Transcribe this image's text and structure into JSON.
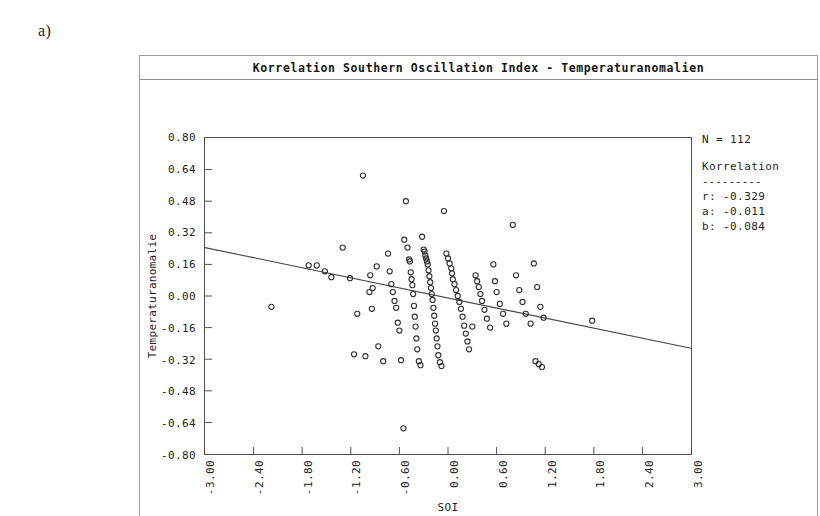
{
  "panel_label": "a)",
  "chart": {
    "title": "Korrelation Southern Oscillation Index - Temperaturanomalien",
    "y_axis_title": "Temperaturanomalie",
    "x_axis_title": "SOI"
  },
  "stats": {
    "n_label": "N = 112",
    "heading": "Korrelation",
    "rule": "---------",
    "r_line": "r: -0.329",
    "a_line": "a: -0.011",
    "b_line": "b: -0.084"
  },
  "chart_data": {
    "type": "scatter",
    "title": "Korrelation Southern Oscillation Index - Temperaturanomalien",
    "xlabel": "SOI",
    "ylabel": "Temperaturanomalie",
    "xlim": [
      -3.0,
      3.0
    ],
    "ylim": [
      -0.8,
      0.8
    ],
    "xticks": [
      -3.0,
      -2.4,
      -1.8,
      -1.2,
      -0.6,
      0.0,
      0.6,
      1.2,
      1.8,
      2.4,
      3.0
    ],
    "xtick_labels": [
      "-3.00",
      "-2.40",
      "-1.80",
      "-1.20",
      "-0.60",
      "0.00",
      "0.60",
      "1.20",
      "1.80",
      "2.40",
      "3.00"
    ],
    "yticks": [
      0.8,
      0.64,
      0.48,
      0.32,
      0.16,
      0.0,
      -0.16,
      -0.32,
      -0.48,
      -0.64,
      -0.8
    ],
    "ytick_labels": [
      "0.80",
      "0.64",
      "0.48",
      "0.32",
      "0.16",
      "0.00",
      "-0.16",
      "-0.32",
      "-0.48",
      "-0.64",
      "-0.80"
    ],
    "grid": false,
    "legend": "none",
    "marker": "open-circle",
    "n_points": 112,
    "correlation_r": -0.329,
    "fit_slope_a": -0.011,
    "fit_intercept_b": -0.084,
    "regression_line": {
      "x0": -3.0,
      "y0": 0.245,
      "x1": 3.0,
      "y1": -0.265
    },
    "points": [
      [
        -2.18,
        -0.055
      ],
      [
        -1.72,
        0.155
      ],
      [
        -1.62,
        0.155
      ],
      [
        -1.52,
        0.125
      ],
      [
        -1.44,
        0.095
      ],
      [
        -1.3,
        0.245
      ],
      [
        -1.05,
        0.61
      ],
      [
        -1.21,
        0.09
      ],
      [
        -1.12,
        -0.09
      ],
      [
        -1.16,
        -0.295
      ],
      [
        -1.02,
        -0.305
      ],
      [
        -0.96,
        0.105
      ],
      [
        -0.97,
        0.02
      ],
      [
        -0.93,
        0.04
      ],
      [
        -0.94,
        -0.065
      ],
      [
        -0.88,
        0.15
      ],
      [
        -0.86,
        -0.255
      ],
      [
        -0.8,
        -0.33
      ],
      [
        -0.74,
        0.215
      ],
      [
        -0.72,
        0.125
      ],
      [
        -0.7,
        0.06
      ],
      [
        -0.68,
        0.02
      ],
      [
        -0.66,
        -0.025
      ],
      [
        -0.64,
        -0.06
      ],
      [
        -0.62,
        -0.135
      ],
      [
        -0.6,
        -0.175
      ],
      [
        -0.58,
        -0.325
      ],
      [
        -0.55,
        -0.67
      ],
      [
        -0.52,
        0.48
      ],
      [
        -0.54,
        0.285
      ],
      [
        -0.5,
        0.245
      ],
      [
        -0.48,
        0.185
      ],
      [
        -0.47,
        0.175
      ],
      [
        -0.46,
        0.12
      ],
      [
        -0.45,
        0.085
      ],
      [
        -0.44,
        0.055
      ],
      [
        -0.43,
        0.01
      ],
      [
        -0.42,
        -0.05
      ],
      [
        -0.41,
        -0.105
      ],
      [
        -0.4,
        -0.155
      ],
      [
        -0.39,
        -0.215
      ],
      [
        -0.38,
        -0.27
      ],
      [
        -0.36,
        -0.33
      ],
      [
        -0.34,
        -0.35
      ],
      [
        -0.32,
        0.3
      ],
      [
        -0.3,
        0.235
      ],
      [
        -0.29,
        0.225
      ],
      [
        -0.28,
        0.205
      ],
      [
        -0.27,
        0.19
      ],
      [
        -0.26,
        0.175
      ],
      [
        -0.25,
        0.16
      ],
      [
        -0.24,
        0.13
      ],
      [
        -0.23,
        0.1
      ],
      [
        -0.22,
        0.07
      ],
      [
        -0.21,
        0.04
      ],
      [
        -0.2,
        0.01
      ],
      [
        -0.19,
        -0.02
      ],
      [
        -0.18,
        -0.06
      ],
      [
        -0.17,
        -0.1
      ],
      [
        -0.16,
        -0.14
      ],
      [
        -0.15,
        -0.175
      ],
      [
        -0.14,
        -0.215
      ],
      [
        -0.13,
        -0.255
      ],
      [
        -0.12,
        -0.3
      ],
      [
        -0.1,
        -0.335
      ],
      [
        -0.08,
        -0.355
      ],
      [
        -0.05,
        0.43
      ],
      [
        -0.02,
        0.215
      ],
      [
        0.0,
        0.19
      ],
      [
        0.02,
        0.165
      ],
      [
        0.04,
        0.14
      ],
      [
        0.05,
        0.115
      ],
      [
        0.06,
        0.085
      ],
      [
        0.08,
        0.06
      ],
      [
        0.1,
        0.03
      ],
      [
        0.12,
        0.0
      ],
      [
        0.14,
        -0.03
      ],
      [
        0.16,
        -0.065
      ],
      [
        0.18,
        -0.105
      ],
      [
        0.2,
        -0.15
      ],
      [
        0.22,
        -0.19
      ],
      [
        0.24,
        -0.23
      ],
      [
        0.26,
        -0.27
      ],
      [
        0.3,
        -0.155
      ],
      [
        0.34,
        0.105
      ],
      [
        0.36,
        0.075
      ],
      [
        0.38,
        0.045
      ],
      [
        0.4,
        0.01
      ],
      [
        0.42,
        -0.025
      ],
      [
        0.45,
        -0.07
      ],
      [
        0.48,
        -0.115
      ],
      [
        0.52,
        -0.16
      ],
      [
        0.56,
        0.16
      ],
      [
        0.58,
        0.075
      ],
      [
        0.6,
        0.02
      ],
      [
        0.64,
        -0.04
      ],
      [
        0.68,
        -0.09
      ],
      [
        0.72,
        -0.14
      ],
      [
        0.8,
        0.36
      ],
      [
        0.84,
        0.105
      ],
      [
        0.88,
        0.03
      ],
      [
        0.92,
        -0.03
      ],
      [
        0.96,
        -0.09
      ],
      [
        1.02,
        -0.14
      ],
      [
        1.06,
        0.165
      ],
      [
        1.1,
        0.045
      ],
      [
        1.14,
        -0.055
      ],
      [
        1.18,
        -0.11
      ],
      [
        1.08,
        -0.33
      ],
      [
        1.12,
        -0.345
      ],
      [
        1.16,
        -0.36
      ],
      [
        1.78,
        -0.125
      ]
    ]
  }
}
